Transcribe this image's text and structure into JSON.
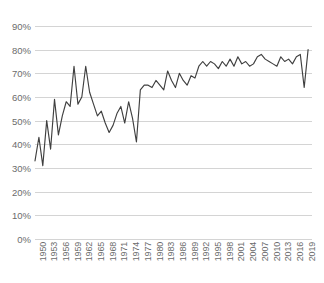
{
  "chart_data": {
    "type": "line",
    "title": "",
    "xlabel": "",
    "ylabel": "",
    "ylim": [
      0,
      90
    ],
    "xlim": [
      1950,
      2021
    ],
    "grid": true,
    "legend": false,
    "y_tick_labels": [
      "90%",
      "80%",
      "70%",
      "60%",
      "50%",
      "40%",
      "30%",
      "20%",
      "10%",
      "0%"
    ],
    "y_tick_values": [
      90,
      80,
      70,
      60,
      50,
      40,
      30,
      20,
      10,
      0
    ],
    "x_tick_labels": [
      "1950",
      "1953",
      "1956",
      "1959",
      "1962",
      "1965",
      "1968",
      "1971",
      "1974",
      "1977",
      "1980",
      "1983",
      "1986",
      "1989",
      "1992",
      "1995",
      "1998",
      "2001",
      "2004",
      "2007",
      "2010",
      "2013",
      "2016",
      "2019"
    ],
    "x_tick_values": [
      1950,
      1953,
      1956,
      1959,
      1962,
      1965,
      1968,
      1971,
      1974,
      1977,
      1980,
      1983,
      1986,
      1989,
      1992,
      1995,
      1998,
      2001,
      2004,
      2007,
      2010,
      2013,
      2016,
      2019
    ],
    "line_color": "#404040",
    "grid_color": "#d4d4d4",
    "tick_label_color": "#6b6b6b",
    "series": [
      {
        "name": "value",
        "x": [
          1950,
          1951,
          1952,
          1953,
          1954,
          1955,
          1956,
          1957,
          1958,
          1959,
          1960,
          1961,
          1962,
          1963,
          1964,
          1965,
          1966,
          1967,
          1968,
          1969,
          1970,
          1971,
          1972,
          1973,
          1974,
          1975,
          1976,
          1977,
          1978,
          1979,
          1980,
          1981,
          1982,
          1983,
          1984,
          1985,
          1986,
          1987,
          1988,
          1989,
          1990,
          1991,
          1992,
          1993,
          1994,
          1995,
          1996,
          1997,
          1998,
          1999,
          2000,
          2001,
          2002,
          2003,
          2004,
          2005,
          2006,
          2007,
          2008,
          2009,
          2010,
          2011,
          2012,
          2013,
          2014,
          2015,
          2016,
          2017,
          2018,
          2019,
          2020
        ],
        "values": [
          33,
          43,
          31,
          50,
          38,
          59,
          44,
          52,
          58,
          56,
          73,
          57,
          60,
          73,
          62,
          57,
          52,
          54,
          49,
          45,
          48,
          53,
          56,
          49,
          58,
          51,
          41,
          63,
          65,
          65,
          64,
          67,
          65,
          63,
          71,
          67,
          64,
          70,
          67,
          65,
          69,
          68,
          73,
          75,
          73,
          75,
          74,
          72,
          75,
          73,
          76,
          73,
          77,
          74,
          75,
          73,
          74,
          77,
          78,
          76,
          75,
          74,
          73,
          77,
          75,
          76,
          74,
          77,
          78,
          64,
          80
        ]
      }
    ]
  }
}
